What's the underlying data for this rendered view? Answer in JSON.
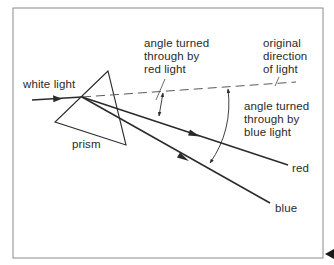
{
  "diagram": {
    "type": "prism-dispersion",
    "labels": {
      "white_light": "white light",
      "prism": "prism",
      "red_angle": [
        "angle turned",
        "through by",
        "red light"
      ],
      "original_direction": [
        "original",
        "direction",
        "of light"
      ],
      "blue_angle": [
        "angle turned",
        "through by",
        "blue light"
      ],
      "red": "red",
      "blue": "blue"
    },
    "rays": [
      {
        "name": "incident white light",
        "style": "solid"
      },
      {
        "name": "original direction",
        "style": "dashed"
      },
      {
        "name": "red",
        "style": "solid"
      },
      {
        "name": "blue",
        "style": "solid"
      }
    ],
    "colors": {
      "line": "#2a2a2a",
      "frame": "#8a8a8a",
      "background": "#ffffff"
    },
    "nav": {
      "next_marker": "left-pointing triangle"
    }
  }
}
